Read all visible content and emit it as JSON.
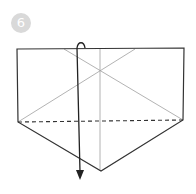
{
  "step": {
    "number": "6"
  },
  "diagram": {
    "colors": {
      "outline": "#333333",
      "crease": "#999999",
      "arrow": "#222222",
      "badge": "#d9d9d9"
    }
  }
}
